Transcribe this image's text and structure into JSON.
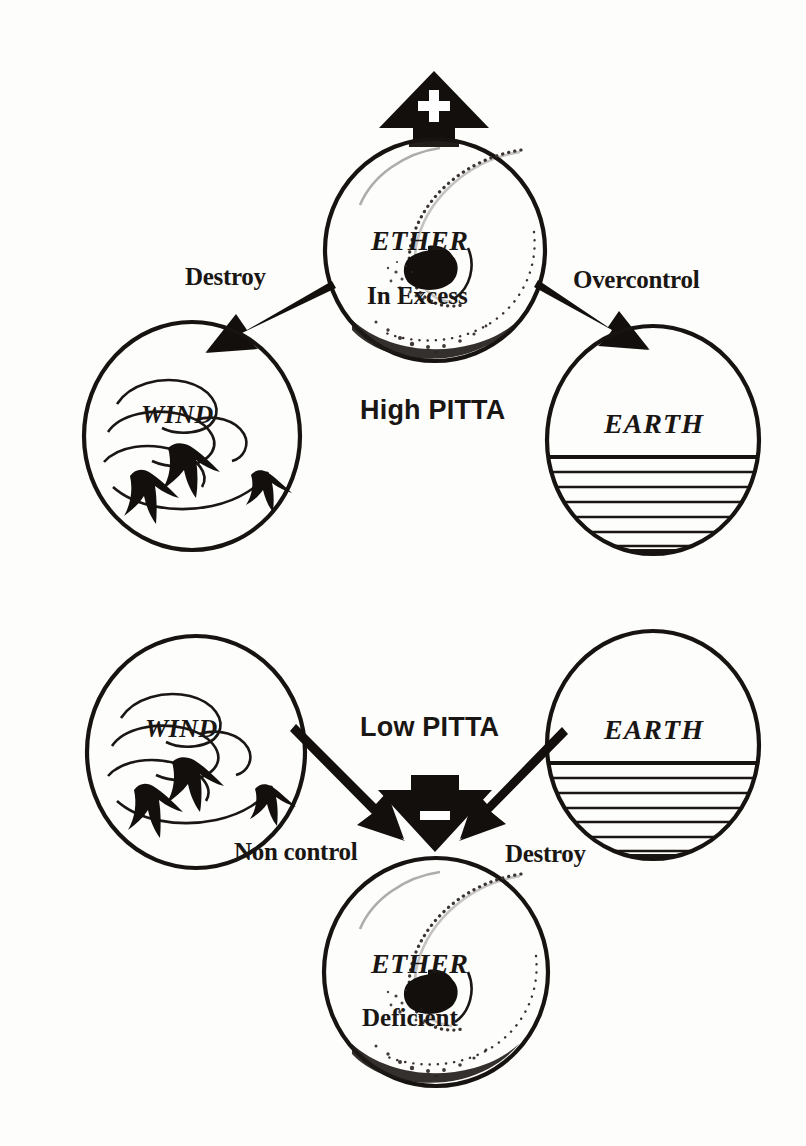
{
  "diagram": {
    "ink_color": "#1a1613",
    "background_color": "#ffffff"
  },
  "sections": {
    "top": {
      "state_label": "High PITTA",
      "sign_glyph": "+",
      "sign_name": "plus-sign",
      "source": {
        "element": "ETHER",
        "state": "In Excess"
      },
      "targets": [
        {
          "element": "WIND",
          "relation": "Destroy"
        },
        {
          "element": "EARTH",
          "relation": "Overcontrol"
        }
      ]
    },
    "bottom": {
      "state_label": "Low PITTA",
      "sign_glyph": "–",
      "sign_name": "minus-sign",
      "sources": [
        {
          "element": "WIND",
          "relation": "Non control"
        },
        {
          "element": "EARTH",
          "relation": "Destroy"
        }
      ],
      "target": {
        "element": "ETHER",
        "state": "Deficient"
      }
    }
  },
  "labels": {
    "top_ether_name": "ETHER",
    "top_ether_state": "In Excess",
    "top_destroy": "Destroy",
    "top_overcontrol": "Overcontrol",
    "top_wind": "WIND",
    "top_earth": "EARTH",
    "high_pitta": "High PITTA",
    "bottom_wind": "WIND",
    "bottom_earth": "EARTH",
    "low_pitta": "Low PITTA",
    "bottom_non_control": "Non control",
    "bottom_destroy": "Destroy",
    "bottom_ether_name": "ETHER",
    "bottom_ether_state": "Deficient"
  }
}
